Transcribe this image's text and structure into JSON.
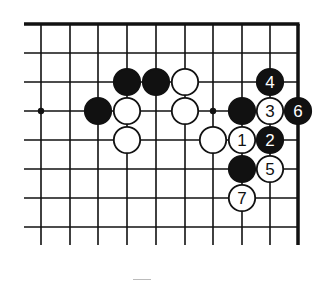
{
  "diagram": {
    "type": "go-board-fragment",
    "colors": {
      "line": "#111111",
      "black_stone": "#111111",
      "white_stone": "#ffffff",
      "background": "#ffffff"
    },
    "grid": {
      "x": [
        41,
        70,
        98,
        127,
        156,
        185,
        213,
        242,
        270,
        298
      ],
      "y": [
        24,
        53,
        82,
        111,
        140,
        169,
        198,
        227
      ],
      "line_bottom": 245,
      "line_left": 24,
      "top_edge": true,
      "right_edge": true
    },
    "hoshi": [
      {
        "col": 0,
        "row": 3
      },
      {
        "col": 6,
        "row": 3
      }
    ],
    "stones": [
      {
        "color": "black",
        "col": 3,
        "row": 2,
        "label": ""
      },
      {
        "color": "black",
        "col": 4,
        "row": 2,
        "label": ""
      },
      {
        "color": "white",
        "col": 5,
        "row": 2,
        "label": ""
      },
      {
        "color": "black",
        "col": 8,
        "row": 2,
        "label": "4"
      },
      {
        "color": "black",
        "col": 2,
        "row": 3,
        "label": ""
      },
      {
        "color": "white",
        "col": 3,
        "row": 3,
        "label": ""
      },
      {
        "color": "white",
        "col": 5,
        "row": 3,
        "label": ""
      },
      {
        "color": "black",
        "col": 7,
        "row": 3,
        "label": ""
      },
      {
        "color": "white",
        "col": 8,
        "row": 3,
        "label": "3"
      },
      {
        "color": "black",
        "col": 9,
        "row": 3,
        "label": "6"
      },
      {
        "color": "white",
        "col": 3,
        "row": 4,
        "label": ""
      },
      {
        "color": "white",
        "col": 6,
        "row": 4,
        "label": ""
      },
      {
        "color": "white",
        "col": 7,
        "row": 4,
        "label": "1"
      },
      {
        "color": "black",
        "col": 8,
        "row": 4,
        "label": "2"
      },
      {
        "color": "black",
        "col": 7,
        "row": 5,
        "label": ""
      },
      {
        "color": "white",
        "col": 8,
        "row": 5,
        "label": "5"
      },
      {
        "color": "white",
        "col": 7,
        "row": 6,
        "label": "7"
      }
    ]
  }
}
